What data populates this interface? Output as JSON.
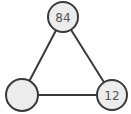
{
  "diagram": {
    "type": "graph",
    "colors": {
      "node_fill": "#ececec",
      "stroke": "#3a3a3a",
      "label": "#555555",
      "background": "#ffffff"
    },
    "nodes": [
      {
        "id": "top",
        "label": "84",
        "cx": 63,
        "cy": 17,
        "r": 15
      },
      {
        "id": "bottom-left",
        "label": "",
        "cx": 22,
        "cy": 95,
        "r": 16
      },
      {
        "id": "bottom-right",
        "label": "12",
        "cx": 112,
        "cy": 95,
        "r": 15
      }
    ],
    "edges": [
      {
        "from": "top",
        "to": "bottom-left"
      },
      {
        "from": "top",
        "to": "bottom-right"
      },
      {
        "from": "bottom-left",
        "to": "bottom-right"
      }
    ]
  }
}
